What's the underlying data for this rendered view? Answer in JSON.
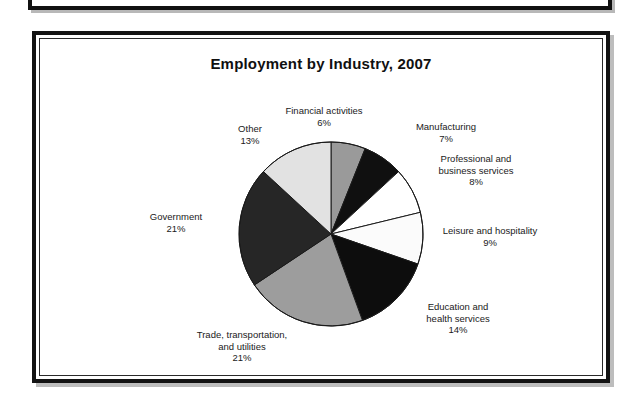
{
  "figure": {
    "title": "Employment by Industry, 2007"
  },
  "chart_data": {
    "type": "pie",
    "title": "Employment by Industry, 2007",
    "xlabel": "",
    "ylabel": "",
    "units": "percent",
    "legend_position": "none",
    "grid": false,
    "labels_outside": true,
    "start_angle_deg": 0,
    "direction": "clockwise",
    "categories": [
      "Financial activities",
      "Manufacturing",
      "Professional and business services",
      "Leisure and hospitality",
      "Education and health services",
      "Trade, transportation, and utilities",
      "Government",
      "Other"
    ],
    "values": [
      6,
      7,
      8,
      9,
      14,
      21,
      21,
      13
    ],
    "value_labels": [
      "6%",
      "7%",
      "8%",
      "9%",
      "14%",
      "21%",
      "21%",
      "13%"
    ],
    "slice_colors": [
      "#9a9a9a",
      "#101010",
      "#ffffff",
      "#fbfbfb",
      "#0d0d0d",
      "#9d9d9d",
      "#262626",
      "#e2e2e2"
    ],
    "slice_edge_color": "#1a1a1a"
  },
  "labels": {
    "financial": {
      "name": "Financial activities",
      "value": "6%"
    },
    "manufacturing": {
      "name": "Manufacturing",
      "value": "7%"
    },
    "professional": {
      "name_line1": "Professional and",
      "name_line2": "business services",
      "value": "8%"
    },
    "leisure": {
      "name": "Leisure and hospitality",
      "value": "9%"
    },
    "education": {
      "name_line1": "Education and",
      "name_line2": "health services",
      "value": "14%"
    },
    "trade": {
      "name_line1": "Trade, transportation,",
      "name_line2": "and utilities",
      "value": "21%"
    },
    "government": {
      "name": "Government",
      "value": "21%"
    },
    "other": {
      "name": "Other",
      "value": "13%"
    }
  }
}
